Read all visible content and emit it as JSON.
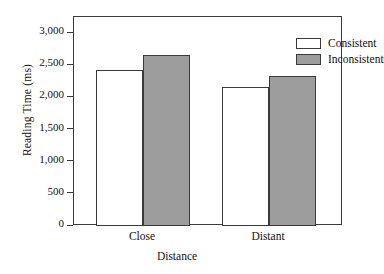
{
  "chart_data": {
    "type": "bar",
    "title": "",
    "xlabel": "Distance",
    "ylabel": "Reading Time (ms)",
    "categories": [
      "Close",
      "Distant"
    ],
    "series": [
      {
        "name": "Consistent",
        "values": [
          2430,
          2160
        ],
        "color": "#ffffff"
      },
      {
        "name": "Inconsistent",
        "values": [
          2660,
          2340
        ],
        "color": "#9d9d9d"
      }
    ],
    "ylim": [
      0,
      3250
    ],
    "yticks": [
      0,
      500,
      1000,
      1500,
      2000,
      2500,
      3000
    ],
    "ytick_labels": [
      "0",
      "500",
      "1,000",
      "1,500",
      "2,000",
      "2,500",
      "3,000"
    ],
    "grid": false,
    "legend_position": "top-right",
    "frame": true,
    "axis_color": "#3a3a3a"
  },
  "legend": {
    "items": [
      {
        "label": "Consistent",
        "swatch": "consistent"
      },
      {
        "label": "Inconsistent",
        "swatch": "inconsistent"
      }
    ]
  }
}
